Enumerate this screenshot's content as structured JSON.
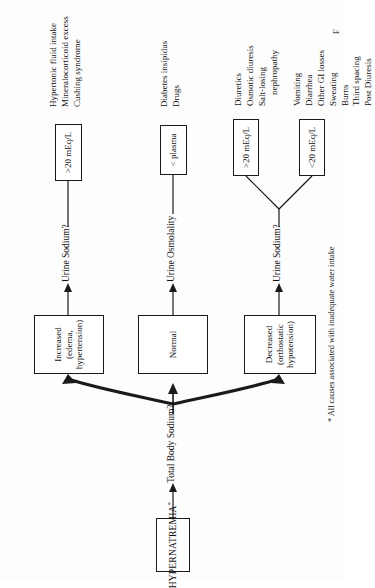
{
  "figure": {
    "type": "flowchart",
    "orientation": "rotated-90-ccw",
    "root": {
      "label": "HYPERNATREMIA",
      "footnote_marker": "*"
    },
    "root_question": "Total Body Sodium?",
    "footnote": "* All causes associated with inadequate water intake",
    "caption_partial": "F",
    "branches": [
      {
        "id": "decreased",
        "node_line1": "Decreased",
        "node_line2": "(orthostatic hypotension)",
        "question": "Urine Sodium?",
        "outcomes": [
          {
            "id": "decreased-lt20",
            "box": "<20 mEq/L",
            "causes": [
              "Vomiting",
              "Diarrhea",
              "Other GI losses",
              "Sweating",
              "Burns",
              "Third spacing",
              "Post Diuresis"
            ]
          },
          {
            "id": "decreased-gt20",
            "box": ">20 mEq/L",
            "causes": [
              "Diuretics",
              "Osmotic diuresis",
              "Salt-losing",
              "nephropathy"
            ]
          }
        ]
      },
      {
        "id": "normal",
        "node_line1": "Normal",
        "node_line2": "",
        "question": "Urine Osmolality",
        "outcomes": [
          {
            "id": "normal-lt-plasma",
            "box": "< plasma",
            "causes": [
              "Diabetes insipidus",
              "Drugs"
            ]
          }
        ]
      },
      {
        "id": "increased",
        "node_line1": "Increased",
        "node_line2": "(edema, hypertension)",
        "question": "Urine Sodium?",
        "outcomes": [
          {
            "id": "increased-gt20",
            "box": ">20 mEq/L",
            "causes": [
              "Hypertonic fluid intake",
              "Mineralocorticoid excess",
              "Cushing syndrome"
            ]
          }
        ]
      }
    ],
    "colors": {
      "ink": "#1a1a1a",
      "paper": "#fdfdfd",
      "box_fill": "#ffffff"
    }
  }
}
